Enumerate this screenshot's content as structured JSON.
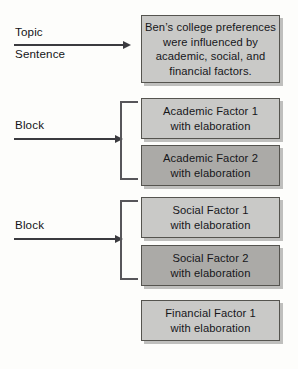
{
  "diagram": {
    "background_color": "#fdfdfb",
    "box_fill_light": "#c9c9c7",
    "box_fill_dark": "#abaaa7",
    "box_border_color": "#55544f",
    "arrow_color": "#3b3b3f",
    "bracket_color": "#57565a"
  },
  "labels": [
    {
      "id": "topic-sentence",
      "line1": "Topic",
      "line2": "Sentence"
    },
    {
      "id": "block-academic",
      "line1": "Block",
      "line2": ""
    },
    {
      "id": "block-social",
      "line1": "Block",
      "line2": ""
    }
  ],
  "boxes": [
    {
      "id": "topic-sentence-box",
      "shade": "light",
      "lines": [
        "Ben’s college preferences",
        "were influenced by",
        "academic, social, and",
        "financial factors."
      ]
    },
    {
      "id": "academic-factor-1",
      "shade": "light",
      "lines": [
        "Academic Factor 1",
        "with elaboration"
      ]
    },
    {
      "id": "academic-factor-2",
      "shade": "dark",
      "lines": [
        "Academic Factor 2",
        "with elaboration"
      ]
    },
    {
      "id": "social-factor-1",
      "shade": "light",
      "lines": [
        "Social Factor 1",
        "with elaboration"
      ]
    },
    {
      "id": "social-factor-2",
      "shade": "dark",
      "lines": [
        "Social Factor 2",
        "with elaboration"
      ]
    },
    {
      "id": "financial-factor-1",
      "shade": "light",
      "lines": [
        "Financial Factor 1",
        "with elaboration"
      ]
    }
  ]
}
